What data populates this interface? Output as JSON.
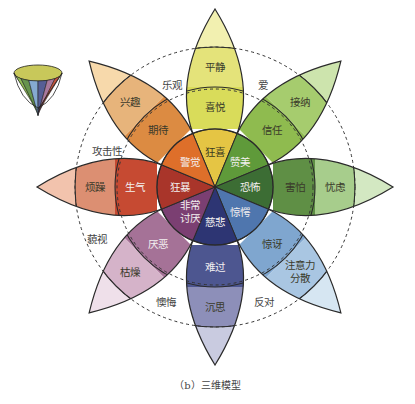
{
  "top_text": "（a）二维模型",
  "caption": "（b）三维模型",
  "center": [
    215,
    187
  ],
  "petals": [
    {
      "angle": -90,
      "outer_label": "平静",
      "middle_label": "喜悦",
      "inner_label": "狂喜",
      "colors": [
        "#f2f0b0",
        "#e4e37a",
        "#d9dc5a",
        "#e5c544"
      ]
    },
    {
      "angle": -45,
      "outer_label": "接纳",
      "middle_label": "信任",
      "inner_label": "赞美",
      "colors": [
        "#cde4ad",
        "#a6cc6e",
        "#8fbb4f",
        "#5f9a3a"
      ]
    },
    {
      "angle": 0,
      "outer_label": "忧虑",
      "middle_label": "害怕",
      "inner_label": "恐怖",
      "colors": [
        "#d3e8c2",
        "#a7cd8c",
        "#5f8f45",
        "#3c6d34"
      ]
    },
    {
      "angle": 45,
      "outer_label": "注意力分散",
      "middle_label": "惊讶",
      "inner_label": "惊愕",
      "colors": [
        "#d6e6f2",
        "#a9c6e2",
        "#7fa6cf",
        "#4f76ae"
      ]
    },
    {
      "angle": 90,
      "outer_label": "沉思",
      "middle_label": "难过",
      "inner_label": "悲伤",
      "colors": [
        "#c9cbe0",
        "#8d8fb9",
        "#4d5690",
        "#2d3573"
      ]
    },
    {
      "angle": 135,
      "outer_label": "厌倦",
      "middle_label": "厌恶",
      "inner_label": "非常讨厌",
      "colors": [
        "#efe0ea",
        "#d5b3c9",
        "#a57297",
        "#7b3f72"
      ]
    },
    {
      "angle": 180,
      "outer_label": "烦躁",
      "middle_label": "生气",
      "inner_label": "狂暴",
      "colors": [
        "#f2c3ad",
        "#dc8f72",
        "#c64a32",
        "#a9352a"
      ]
    },
    {
      "angle": -135,
      "outer_label": "兴趣",
      "middle_label": "期待",
      "inner_label": "警觉",
      "colors": [
        "#f7d9ab",
        "#e7b47b",
        "#dc8b42",
        "#de6f2a"
      ]
    }
  ],
  "labels_shown": {
    "inner": [
      "狂喜",
      "赞美",
      "恐怖",
      "惊愕",
      "悲伤",
      "非常讨厌",
      "狂暴",
      "警觉"
    ],
    "middle": [
      "喜悦",
      "信任",
      "害怕",
      "惊讶",
      "难过",
      "厌恶",
      "生气",
      "期待"
    ],
    "outer": [
      "平静",
      "接纳",
      "忧虑",
      "注意力分散",
      "沉思",
      "厌倦",
      "烦躁",
      "兴趣"
    ]
  },
  "dyads": [
    {
      "label": "乐观",
      "x": 172,
      "y": 89
    },
    {
      "label": "爱",
      "x": 263,
      "y": 89
    },
    {
      "label": "攻击性",
      "x": 107,
      "y": 155
    },
    {
      "label": "藐视",
      "x": 97,
      "y": 243
    },
    {
      "label": "懊悔",
      "x": 166,
      "y": 306
    },
    {
      "label": "反对",
      "x": 264,
      "y": 306
    }
  ],
  "text_overrides": {
    "悲伤": "慈悲",
    "厌倦": "枯燥",
    "惊愕": "惊愕"
  }
}
